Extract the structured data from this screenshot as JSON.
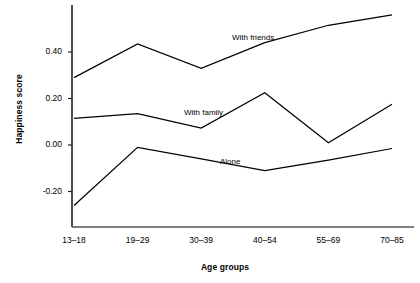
{
  "chart_data": {
    "type": "line",
    "title": "",
    "xlabel": "Age groups",
    "ylabel": "Happiness score",
    "categories": [
      "13–18",
      "19–29",
      "30–39",
      "40–54",
      "55–69",
      "70–85"
    ],
    "yticks": [
      "0.40",
      "0.20",
      "0.00",
      "-0.20"
    ],
    "ytick_values": [
      0.4,
      0.2,
      0.0,
      -0.2
    ],
    "ylim": [
      -0.32,
      0.62
    ],
    "grid": false,
    "legend_position": "inline-annotations",
    "series": [
      {
        "name": "With friends",
        "values": [
          0.29,
          0.435,
          0.33,
          0.44,
          0.515,
          0.56
        ],
        "color": "#000000"
      },
      {
        "name": "With family",
        "values": [
          0.115,
          0.135,
          0.073,
          0.225,
          0.01,
          0.175
        ],
        "color": "#000000"
      },
      {
        "name": "Alone",
        "values": [
          -0.26,
          -0.01,
          -0.06,
          -0.11,
          -0.065,
          -0.015
        ],
        "color": "#000000"
      }
    ],
    "annotations": [
      {
        "text": "With friends",
        "x": 232,
        "y": 33
      },
      {
        "text": "With family",
        "x": 184,
        "y": 108
      },
      {
        "text": "Alone",
        "x": 220,
        "y": 157
      }
    ]
  }
}
